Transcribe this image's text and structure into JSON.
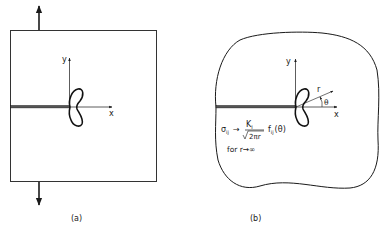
{
  "figure_a": {
    "caption": "(a)",
    "x_axis_label": "x",
    "y_axis_label": "y"
  },
  "figure_b": {
    "caption": "(b)",
    "x_axis_label": "x",
    "y_axis_label": "y",
    "radius_label": "r",
    "angle_label": "θ",
    "formula": {
      "lhs": "σ",
      "lhs_sub": "ij",
      "arrow": "→",
      "numerator": "K",
      "numerator_sub": "I",
      "denominator": "2πr",
      "func": "f",
      "func_sub": "ij",
      "func_arg": "(θ)",
      "condition": "for r→∞"
    }
  },
  "colors": {
    "ink": "#1a1a1a",
    "background": "#ffffff"
  }
}
